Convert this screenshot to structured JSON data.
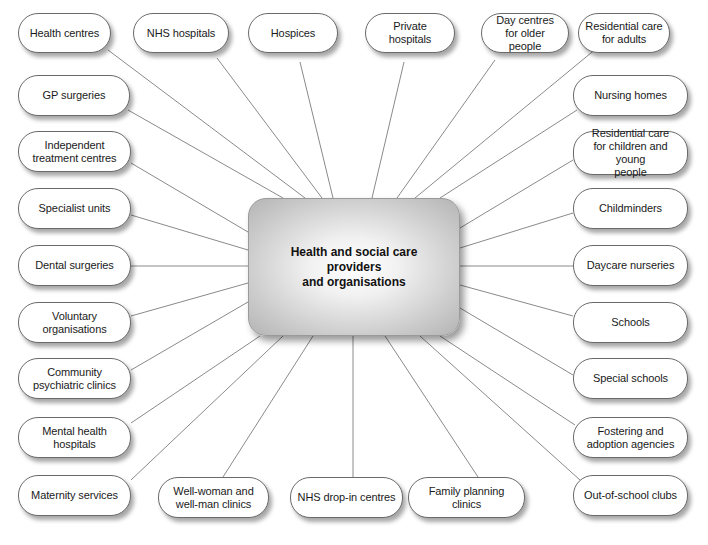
{
  "diagram": {
    "center": {
      "label": "Health and social care\nproviders\nand organisations"
    },
    "nodes": [
      {
        "id": "health-centres",
        "label": "Health centres",
        "x": 18,
        "y": 13,
        "w": 93,
        "h": 40
      },
      {
        "id": "nhs-hospitals",
        "label": "NHS hospitals",
        "x": 133,
        "y": 13,
        "w": 96,
        "h": 40
      },
      {
        "id": "hospices",
        "label": "Hospices",
        "x": 248,
        "y": 13,
        "w": 90,
        "h": 40
      },
      {
        "id": "private-hospitals",
        "label": "Private hospitals",
        "x": 365,
        "y": 13,
        "w": 90,
        "h": 40
      },
      {
        "id": "day-centres",
        "label": "Day centres\nfor older people",
        "x": 481,
        "y": 13,
        "w": 88,
        "h": 40
      },
      {
        "id": "residential-care-adults",
        "label": "Residential care\nfor adults",
        "x": 578,
        "y": 13,
        "w": 92,
        "h": 40
      },
      {
        "id": "gp-surgeries",
        "label": "GP surgeries",
        "x": 18,
        "y": 75,
        "w": 112,
        "h": 41
      },
      {
        "id": "independent-treatment-centres",
        "label": "Independent\ntreatment centres",
        "x": 18,
        "y": 131,
        "w": 113,
        "h": 41
      },
      {
        "id": "specialist-units",
        "label": "Specialist units",
        "x": 18,
        "y": 188,
        "w": 113,
        "h": 41
      },
      {
        "id": "dental-surgeries",
        "label": "Dental surgeries",
        "x": 18,
        "y": 245,
        "w": 113,
        "h": 41
      },
      {
        "id": "voluntary-organisations",
        "label": "Voluntary\norganisations",
        "x": 18,
        "y": 302,
        "w": 113,
        "h": 41
      },
      {
        "id": "community-psychiatric-clinics",
        "label": "Community\npsychiatric clinics",
        "x": 18,
        "y": 358,
        "w": 113,
        "h": 41
      },
      {
        "id": "mental-health-hospitals",
        "label": "Mental health\nhospitals",
        "x": 18,
        "y": 417,
        "w": 113,
        "h": 41
      },
      {
        "id": "maternity-services",
        "label": "Maternity services",
        "x": 18,
        "y": 475,
        "w": 113,
        "h": 41
      },
      {
        "id": "nursing-homes",
        "label": "Nursing homes",
        "x": 573,
        "y": 75,
        "w": 115,
        "h": 41
      },
      {
        "id": "residential-care-children",
        "label": "Residential care\nfor children and young\npeople",
        "x": 573,
        "y": 131,
        "w": 115,
        "h": 44
      },
      {
        "id": "childminders",
        "label": "Childminders",
        "x": 573,
        "y": 188,
        "w": 115,
        "h": 41
      },
      {
        "id": "daycare-nurseries",
        "label": "Daycare nurseries",
        "x": 573,
        "y": 245,
        "w": 115,
        "h": 41
      },
      {
        "id": "schools",
        "label": "Schools",
        "x": 573,
        "y": 302,
        "w": 115,
        "h": 41
      },
      {
        "id": "special-schools",
        "label": "Special schools",
        "x": 573,
        "y": 358,
        "w": 115,
        "h": 41
      },
      {
        "id": "fostering-adoption",
        "label": "Fostering and\nadoption agencies",
        "x": 573,
        "y": 417,
        "w": 115,
        "h": 41
      },
      {
        "id": "out-of-school-clubs",
        "label": "Out-of-school clubs",
        "x": 573,
        "y": 475,
        "w": 115,
        "h": 41
      },
      {
        "id": "well-woman-clinics",
        "label": "Well-woman and\nwell-man clinics",
        "x": 158,
        "y": 477,
        "w": 111,
        "h": 41
      },
      {
        "id": "nhs-drop-in-centres",
        "label": "NHS drop-in centres",
        "x": 290,
        "y": 477,
        "w": 113,
        "h": 41
      },
      {
        "id": "family-planning-clinics",
        "label": "Family planning clinics",
        "x": 408,
        "y": 477,
        "w": 117,
        "h": 41
      }
    ],
    "connectors": [
      {
        "from": "health-centres",
        "x1": 108,
        "y1": 50,
        "x2": 305,
        "y2": 198
      },
      {
        "from": "nhs-hospitals",
        "x1": 217,
        "y1": 58,
        "x2": 322,
        "y2": 198
      },
      {
        "from": "hospices",
        "x1": 300,
        "y1": 62,
        "x2": 333,
        "y2": 198
      },
      {
        "from": "private-hospitals",
        "x1": 404,
        "y1": 62,
        "x2": 372,
        "y2": 198
      },
      {
        "from": "day-centres",
        "x1": 495,
        "y1": 60,
        "x2": 397,
        "y2": 198
      },
      {
        "from": "residential-care-adults",
        "x1": 597,
        "y1": 48,
        "x2": 415,
        "y2": 198
      },
      {
        "from": "gp-surgeries",
        "x1": 128,
        "y1": 110,
        "x2": 283,
        "y2": 198
      },
      {
        "from": "independent-treatment-centres",
        "x1": 131,
        "y1": 163,
        "x2": 248,
        "y2": 232
      },
      {
        "from": "specialist-units",
        "x1": 131,
        "y1": 215,
        "x2": 248,
        "y2": 250
      },
      {
        "from": "dental-surgeries",
        "x1": 131,
        "y1": 266,
        "x2": 248,
        "y2": 266
      },
      {
        "from": "voluntary-organisations",
        "x1": 131,
        "y1": 316,
        "x2": 248,
        "y2": 283
      },
      {
        "from": "community-psychiatric-clinics",
        "x1": 131,
        "y1": 370,
        "x2": 248,
        "y2": 302
      },
      {
        "from": "mental-health-hospitals",
        "x1": 131,
        "y1": 423,
        "x2": 260,
        "y2": 336
      },
      {
        "from": "maternity-services",
        "x1": 131,
        "y1": 480,
        "x2": 283,
        "y2": 336
      },
      {
        "from": "well-woman-clinics",
        "x1": 223,
        "y1": 477,
        "x2": 313,
        "y2": 336
      },
      {
        "from": "nhs-drop-in-centres",
        "x1": 353,
        "y1": 477,
        "x2": 353,
        "y2": 336
      },
      {
        "from": "family-planning-clinics",
        "x1": 478,
        "y1": 477,
        "x2": 385,
        "y2": 336
      },
      {
        "from": "out-of-school-clubs",
        "x1": 580,
        "y1": 480,
        "x2": 420,
        "y2": 336
      },
      {
        "from": "fostering-adoption",
        "x1": 575,
        "y1": 425,
        "x2": 440,
        "y2": 336
      },
      {
        "from": "special-schools",
        "x1": 573,
        "y1": 375,
        "x2": 460,
        "y2": 308
      },
      {
        "from": "schools",
        "x1": 573,
        "y1": 316,
        "x2": 460,
        "y2": 285
      },
      {
        "from": "daycare-nurseries",
        "x1": 573,
        "y1": 266,
        "x2": 460,
        "y2": 266
      },
      {
        "from": "childminders",
        "x1": 573,
        "y1": 213,
        "x2": 460,
        "y2": 248
      },
      {
        "from": "residential-care-children",
        "x1": 573,
        "y1": 160,
        "x2": 460,
        "y2": 228
      },
      {
        "from": "nursing-homes",
        "x1": 577,
        "y1": 110,
        "x2": 440,
        "y2": 198
      }
    ],
    "colors": {
      "line": "#8a8a8a",
      "node_border": "#6a6a6a",
      "text": "#1a1a1a"
    }
  }
}
